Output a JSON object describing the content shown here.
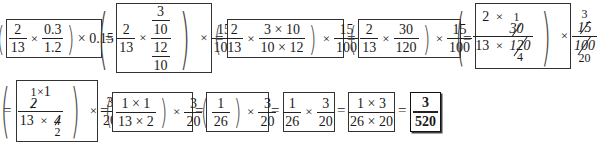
{
  "equals_sign": "=",
  "times_sign": "×",
  "steps": [
    {
      "id": 1,
      "expression": "(2/13 × 0.3/1.2) × 0.15",
      "f1": {
        "num": "2",
        "den": "13"
      },
      "f2": {
        "num": "0.3",
        "den": "1.2"
      },
      "tail": "× 0.15"
    },
    {
      "id": 2,
      "expression": "(2/13 × (3/10)/(12/10)) × 15/100",
      "f1": {
        "num": "2",
        "den": "13"
      },
      "f2": {
        "num_num": "3",
        "num_den": "10",
        "den_num": "12",
        "den_den": "10"
      },
      "f3": {
        "num": "15",
        "den": "100"
      }
    },
    {
      "id": 3,
      "expression": "(2/13 × (3×10)/(10×12)) × 15/100",
      "f1": {
        "num": "2",
        "den": "13"
      },
      "f2": {
        "num": "3 × 10",
        "den": "10 × 12"
      },
      "f3": {
        "num": "15",
        "den": "100"
      }
    },
    {
      "id": 4,
      "expression": "(2/13 × 30/120) × 15/100",
      "f1": {
        "num": "2",
        "den": "13"
      },
      "f2": {
        "num": "30",
        "den": "120"
      },
      "f3": {
        "num": "15",
        "den": "100"
      }
    },
    {
      "id": 5,
      "expression": "((2 × 30)/(13 × 120)) × 15/100 with cancellations",
      "f1": {
        "num_a": "2",
        "num_b": "30",
        "num_b_replace": "1",
        "den_a": "13",
        "den_b": "120",
        "den_b_replace": "4"
      },
      "f2": {
        "num": "15",
        "num_replace": "3",
        "den": "100",
        "den_replace": "20"
      }
    },
    {
      "id": 6,
      "expression": "((2×1)/(13×4)) × 3/20 with cancellations",
      "f1": {
        "num_a": "2",
        "num_a_replace": "1",
        "num_b": "1",
        "den_a": "13",
        "den_b": "4",
        "den_b_replace": "2"
      },
      "f2": {
        "num": "3",
        "den": "20"
      }
    },
    {
      "id": 7,
      "expression": "((1×1)/(13×2)) × 3/20",
      "f1": {
        "num": "1 × 1",
        "den": "13 × 2"
      },
      "f2": {
        "num": "3",
        "den": "20"
      }
    },
    {
      "id": 8,
      "expression": "(1/26) × 3/20",
      "f1": {
        "num": "1",
        "den": "26"
      },
      "f2": {
        "num": "3",
        "den": "20"
      }
    },
    {
      "id": 9,
      "expression": "1/26 × 3/20",
      "f1": {
        "num": "1",
        "den": "26"
      },
      "f2": {
        "num": "3",
        "den": "20"
      }
    },
    {
      "id": 10,
      "expression": "(1 × 3)/(26 × 20)",
      "f1": {
        "num": "1 × 3",
        "den": "26 × 20"
      }
    },
    {
      "id": 11,
      "expression": "3/520",
      "f1": {
        "num": "3",
        "den": "520"
      },
      "is_final_answer": true
    }
  ]
}
